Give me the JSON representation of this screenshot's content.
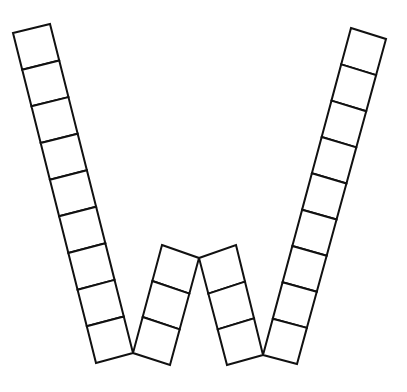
{
  "diagram": {
    "title": "",
    "stroke_color": "#111111",
    "fill_color": "#ffffff",
    "strips": [
      {
        "name": "left-outer-strip",
        "cells": 9,
        "top_a": [
          13,
          33
        ],
        "top_b": [
          50,
          24
        ],
        "bottom_a": [
          96,
          363
        ],
        "bottom_b": [
          133,
          353
        ]
      },
      {
        "name": "left-inner-strip",
        "cells": 3,
        "top_a": [
          162,
          245
        ],
        "top_b": [
          199,
          258
        ],
        "bottom_a": [
          133,
          353
        ],
        "bottom_b": [
          170,
          365
        ]
      },
      {
        "name": "right-inner-strip",
        "cells": 3,
        "top_a": [
          199,
          258
        ],
        "top_b": [
          236,
          245
        ],
        "bottom_a": [
          227,
          365
        ],
        "bottom_b": [
          263,
          355
        ]
      },
      {
        "name": "right-outer-strip",
        "cells": 9,
        "top_a": [
          351,
          28
        ],
        "top_b": [
          386,
          39
        ],
        "bottom_a": [
          263,
          355
        ],
        "bottom_b": [
          297,
          364
        ]
      }
    ]
  }
}
